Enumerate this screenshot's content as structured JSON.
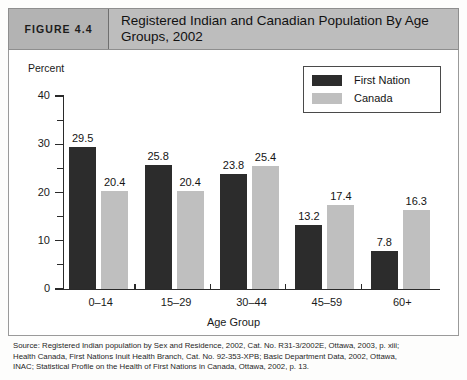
{
  "figure": {
    "number_label": "FIGURE 4.4",
    "title": "Registered Indian and Canadian Population By Age Groups, 2002"
  },
  "legend": {
    "items": [
      {
        "label": "First Nation",
        "color": "#2c2c2c"
      },
      {
        "label": "Canada",
        "color": "#bfbfbf"
      }
    ]
  },
  "source": {
    "line1": "Source: Registered Indian population by Sex and Residence, 2002, Cat. No. R31-3/2002E, Ottawa, 2003, p. xiii;",
    "line2": "Health Canada, First Nations Inuit Health Branch, Cat. No. 92-353-XPB; Basic Department Data, 2002, Ottawa,",
    "line3": "INAC; Statistical Profile on the Health of First Nations in Canada, Ottawa, 2002, p. 13."
  },
  "chart_data": {
    "type": "bar",
    "title": "Registered Indian and Canadian Population By Age Groups, 2002",
    "xlabel": "Age Group",
    "ylabel": "Percent",
    "categories": [
      "0–14",
      "15–29",
      "30–44",
      "45–59",
      "60+"
    ],
    "series": [
      {
        "name": "First Nation",
        "color": "#2c2c2c",
        "values": [
          29.5,
          25.8,
          23.8,
          13.2,
          7.8
        ]
      },
      {
        "name": "Canada",
        "color": "#bfbfbf",
        "values": [
          20.4,
          20.4,
          25.4,
          17.4,
          16.3
        ]
      }
    ],
    "ylim": [
      0,
      40
    ],
    "yticks": [
      0,
      10,
      20,
      30,
      40
    ],
    "ytick_labels": [
      "0",
      "10",
      "20",
      "30",
      "40"
    ],
    "yminor_ticks": [
      5,
      15,
      25,
      35
    ],
    "grid": false,
    "legend_position": "top-right"
  }
}
